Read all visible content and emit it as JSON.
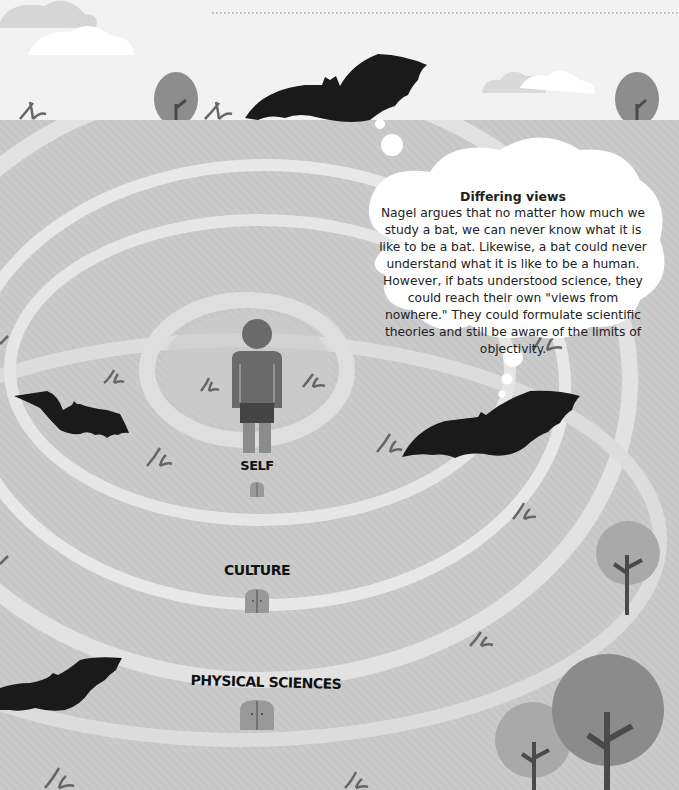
{
  "thought_bubble": {
    "title": "Differing views",
    "body": "Nagel argues that no matter how much we study a bat, we can never know what it is like to be a bat. Likewise, a bat could never understand what it is like to be a human. However, if bats understood science, they could reach their own \"views from nowhere.\" They could formulate scientific theories and still be aware of the limits of objectivity."
  },
  "rings": [
    {
      "label": "SELF"
    },
    {
      "label": "CULTURE"
    },
    {
      "label": "PHYSICAL SCIENCES"
    }
  ],
  "colors": {
    "sky": "#f0f0f0",
    "ground": "#c4c4c4",
    "ring_band": "#e4e4e4",
    "bat": "#1a1a1a",
    "tree_light": "#a8a8a8",
    "tree_dark": "#8a8a8a",
    "trunk": "#4a4a4a",
    "person": "#6a6a6a",
    "door": "#999999"
  }
}
